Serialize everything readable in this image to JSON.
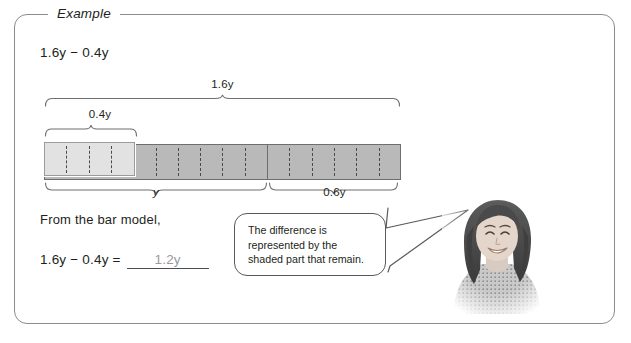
{
  "panel": {
    "legend": "Example"
  },
  "problem": {
    "expression": "1.6y − 0.4y",
    "from_text": "From the bar model,",
    "answer_expression": "1.6y − 0.4y =",
    "answer_value": "1.2y"
  },
  "bar_model": {
    "total_label": "1.6y",
    "part_label": "0.4y",
    "whole_label": "y",
    "remainder_label": "0.6y",
    "total_cells": 16,
    "light_cells": 4,
    "whole_cells": 10,
    "remainder_cells": 6,
    "colors": {
      "shaded": "#b9b9b9",
      "light": "#e2e2e2",
      "outline": "#6e6e6e",
      "dash": "#4a4a4a"
    }
  },
  "callout": {
    "line1": "The difference is",
    "line2": "represented by the",
    "line3": "shaded part that remain."
  },
  "photo": {
    "alt": "smiling-woman-photo"
  }
}
